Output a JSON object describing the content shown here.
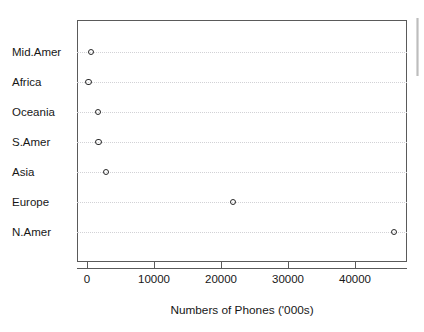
{
  "chart_data": {
    "type": "scatter",
    "title": "",
    "subtitle": "",
    "xlabel": "Numbers of Phones ('000s)",
    "ylabel": "",
    "categories": [
      "N.Amer",
      "Europe",
      "Asia",
      "S.Amer",
      "Oceania",
      "Africa",
      "Mid.Amer"
    ],
    "values": [
      45800,
      21800,
      2840,
      1700,
      1650,
      200,
      600
    ],
    "points": [
      {
        "category": "Mid.Amer",
        "value": 600,
        "row": 0
      },
      {
        "category": "Africa",
        "value": 200,
        "row": 1
      },
      {
        "category": "Oceania",
        "value": 1650,
        "row": 2
      },
      {
        "category": "S.Amer",
        "value": 1700,
        "row": 3
      },
      {
        "category": "Asia",
        "value": 2840,
        "row": 4
      },
      {
        "category": "Europe",
        "value": 21800,
        "row": 5
      },
      {
        "category": "N.Amer",
        "value": 45800,
        "row": 6
      }
    ],
    "xticks": [
      0,
      10000,
      20000,
      30000,
      40000
    ],
    "xtick_labels": [
      "0",
      "10000",
      "20000",
      "30000",
      "40000"
    ],
    "xlim": [
      -1450,
      47800
    ],
    "ylim_rows": 7,
    "grid": "horizontal-dotted",
    "legend": "none",
    "marker": "open-circle",
    "colors": {
      "marker_stroke": "#2b2b2b",
      "frame": "#5a5a5a",
      "gridline": "#d2d2d6",
      "text": "#171717",
      "background": "#ffffff"
    }
  },
  "axis": {
    "x_title": "Numbers of Phones ('000s)",
    "tick_0": "0",
    "tick_1": "10000",
    "tick_2": "20000",
    "tick_3": "30000",
    "tick_4": "40000"
  },
  "rows": {
    "r0": "Mid.Amer",
    "r1": "Africa",
    "r2": "Oceania",
    "r3": "S.Amer",
    "r4": "Asia",
    "r5": "Europe",
    "r6": "N.Amer"
  }
}
